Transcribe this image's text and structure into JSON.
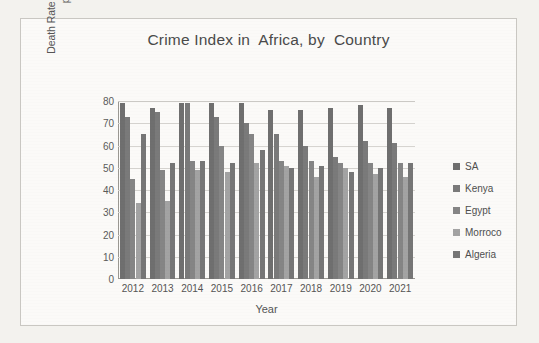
{
  "chart_data": {
    "type": "bar",
    "title": "Crime Index in  Africa, by  Country",
    "xlabel": "Year",
    "ylabel_line1": "Death Rate Per Crime in 100000",
    "ylabel_line2": "population",
    "ylim": [
      0,
      80
    ],
    "yticks": [
      80,
      70,
      60,
      50,
      40,
      30,
      20,
      10,
      0
    ],
    "grid": true,
    "legend_position": "right",
    "categories": [
      "2012",
      "2013",
      "2014",
      "2015",
      "2016",
      "2017",
      "2018",
      "2019",
      "2020",
      "2021"
    ],
    "series": [
      {
        "name": "SA",
        "color": "#6f6f6f",
        "values": [
          79,
          77,
          79,
          79,
          79,
          76,
          76,
          77,
          78,
          77
        ]
      },
      {
        "name": "Kenya",
        "color": "#7a7a7a",
        "values": [
          73,
          75,
          79,
          73,
          70,
          65,
          60,
          55,
          62,
          61
        ]
      },
      {
        "name": "Egypt",
        "color": "#858585",
        "values": [
          45,
          49,
          53,
          60,
          65,
          53,
          53,
          52,
          52,
          52
        ]
      },
      {
        "name": "Morroco",
        "color": "#a3a3a3",
        "values": [
          34,
          35,
          49,
          48,
          52,
          51,
          46,
          50,
          47,
          46
        ]
      },
      {
        "name": "Algeria",
        "color": "#767676",
        "values": [
          65,
          52,
          53,
          52,
          58,
          50,
          51,
          48,
          50,
          52
        ]
      }
    ]
  },
  "legend": {
    "items": [
      {
        "label": "SA"
      },
      {
        "label": "Kenya"
      },
      {
        "label": "Egypt"
      },
      {
        "label": "Morroco"
      },
      {
        "label": "Algeria"
      }
    ]
  }
}
